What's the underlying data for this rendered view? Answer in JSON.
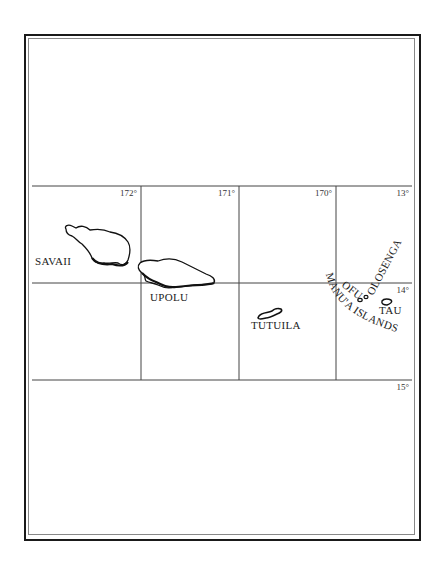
{
  "map": {
    "title": "",
    "colors": {
      "ink": "#1a1a1a",
      "grid": "#444444",
      "background": "#ffffff"
    },
    "grid": {
      "longitude_labels": [
        "172°",
        "171°",
        "170°"
      ],
      "latitude_labels": [
        "13°",
        "14°",
        "15°"
      ]
    },
    "islands": [
      {
        "name": "SAVAII"
      },
      {
        "name": "UPOLU"
      },
      {
        "name": "TUTUILA"
      },
      {
        "name": "OFU"
      },
      {
        "name": "OLOSENGA"
      },
      {
        "name": "TAU"
      }
    ],
    "group_label": "MANU'A ISLANDS"
  }
}
